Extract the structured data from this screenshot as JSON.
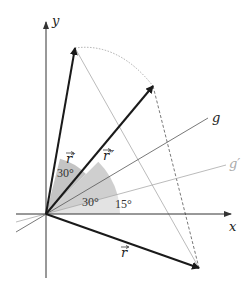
{
  "diagram": {
    "axes": {
      "x_label": "x",
      "y_label": "y"
    },
    "vectors": {
      "r": {
        "label": "r⃗",
        "display": "r"
      },
      "r_prime": {
        "label": "r⃗′",
        "display": "r′"
      },
      "r_double_prime": {
        "label": "r⃗″",
        "display": "r″"
      }
    },
    "lines": {
      "g": "g",
      "g_prime": "g′"
    },
    "angles": {
      "a30_upper": "30°",
      "a30_lower": "30°",
      "a15": "15°"
    },
    "colors": {
      "vector": "#1a1a1a",
      "axis": "#333333",
      "shade_dark": "#c8c8c8",
      "shade_light": "#e0e0e0",
      "g_line": "#555555",
      "g_prime_line": "#aaaaaa",
      "construction": "#999999"
    }
  }
}
